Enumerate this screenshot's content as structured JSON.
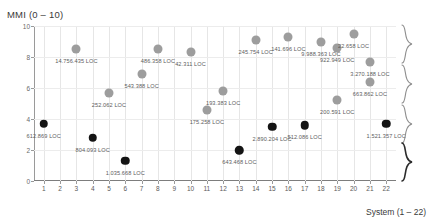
{
  "axes": {
    "y_title": "MMI (0 – 10)",
    "x_title": "System (1 – 22)",
    "y_ticks": [
      "0",
      "2",
      "4",
      "6",
      "8",
      "10"
    ],
    "x_ticks": [
      "1",
      "2",
      "3",
      "4",
      "5",
      "6",
      "7",
      "8",
      "9",
      "10",
      "11",
      "12",
      "13",
      "14",
      "15",
      "16",
      "17",
      "18",
      "19",
      "20",
      "21",
      "22"
    ]
  },
  "colors": {
    "light_marker": "#9d9d9d",
    "dark_marker": "#141414",
    "grid": "#e6e6e6",
    "axis": "#9a9a9a",
    "label_text": "#5c5c5c"
  },
  "braces": [
    {
      "name": "brace-top",
      "style": "light"
    },
    {
      "name": "brace-upper-middle",
      "style": "light"
    },
    {
      "name": "brace-lower-middle",
      "style": "light"
    },
    {
      "name": "brace-bottom",
      "style": "strong"
    }
  ],
  "chart_data": {
    "type": "scatter",
    "title": "",
    "xlabel": "System (1 – 22)",
    "ylabel": "MMI (0 – 10)",
    "xlim": [
      0.4,
      22.6
    ],
    "ylim": [
      0,
      10
    ],
    "grid": true,
    "legend": "none",
    "series": [
      {
        "name": "light",
        "color": "#9d9d9d",
        "points": [
          {
            "x": 3,
            "y": 8.5,
            "label": "14.756.435 LOC",
            "label_dx": 0,
            "label_dy": 9
          },
          {
            "x": 5,
            "y": 5.7,
            "label": "252.062 LOC",
            "label_dx": 0,
            "label_dy": 9
          },
          {
            "x": 7,
            "y": 6.9,
            "label": "543.388 LOC",
            "label_dx": 0,
            "label_dy": 9
          },
          {
            "x": 8,
            "y": 8.5,
            "label": "486.358 LOC",
            "label_dx": 0,
            "label_dy": 9
          },
          {
            "x": 10,
            "y": 8.3,
            "label": "42.311 LOC",
            "label_dx": 0,
            "label_dy": 9
          },
          {
            "x": 11,
            "y": 4.6,
            "label": "175.258 LOC",
            "label_dx": 0,
            "label_dy": 9
          },
          {
            "x": 12,
            "y": 5.8,
            "label": "193.383 LOC",
            "label_dx": 0,
            "label_dy": 9
          },
          {
            "x": 14,
            "y": 9.1,
            "label": "245.754 LOC",
            "label_dx": 0,
            "label_dy": 9
          },
          {
            "x": 16,
            "y": 9.3,
            "label": "141.696 LOC",
            "label_dx": 0,
            "label_dy": 9
          },
          {
            "x": 18,
            "y": 9.0,
            "label": "9.988.363 LOC",
            "label_dx": 0,
            "label_dy": 9
          },
          {
            "x": 19,
            "y": 8.6,
            "label": "922.949 LOC",
            "label_dx": 0,
            "label_dy": 9
          },
          {
            "x": 19,
            "y": 5.2,
            "label": "200.591 LOC",
            "label_dx": 0,
            "label_dy": 9
          },
          {
            "x": 20,
            "y": 9.5,
            "label": "22.658 LOC",
            "label_dx": 0,
            "label_dy": 9
          },
          {
            "x": 21,
            "y": 7.7,
            "label": "3.270.188 LOC",
            "label_dx": 0,
            "label_dy": 9
          },
          {
            "x": 21,
            "y": 6.4,
            "label": "663.862 LOC",
            "label_dx": 0,
            "label_dy": 9
          }
        ]
      },
      {
        "name": "dark",
        "color": "#141414",
        "points": [
          {
            "x": 1,
            "y": 3.7,
            "label": "612.869 LOC",
            "label_dx": 0,
            "label_dy": 9
          },
          {
            "x": 4,
            "y": 2.8,
            "label": "804.093 LOC",
            "label_dx": 0,
            "label_dy": 9
          },
          {
            "x": 6,
            "y": 1.3,
            "label": "1.035.668 LOC",
            "label_dx": 0,
            "label_dy": 9
          },
          {
            "x": 13,
            "y": 2.0,
            "label": "643.468 LOC",
            "label_dx": 0,
            "label_dy": 9
          },
          {
            "x": 15,
            "y": 3.5,
            "label": "2.890.204 LOC",
            "label_dx": 0,
            "label_dy": 9
          },
          {
            "x": 17,
            "y": 3.6,
            "label": "512.086 LOC",
            "label_dx": 0,
            "label_dy": 9
          },
          {
            "x": 22,
            "y": 3.7,
            "label": "1.521.357 LOC",
            "label_dx": 0,
            "label_dy": 9
          }
        ]
      }
    ]
  }
}
